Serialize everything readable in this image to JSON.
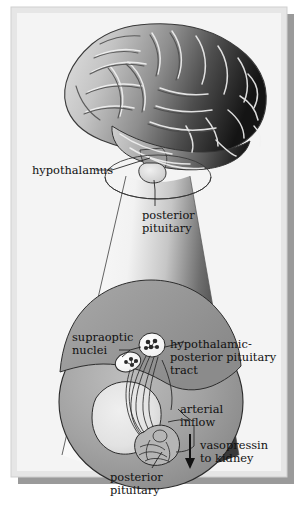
{
  "figure": {
    "type": "anatomical-illustration",
    "dimensions": {
      "width": 302,
      "height": 507
    }
  },
  "frame": {
    "border_color": "#d9d9d9",
    "shadow_color": "#9a9a9a",
    "background_color": "#f3f3f3",
    "page_color": "#ffffff"
  },
  "palette": {
    "brain_light": "#d8d8d8",
    "brain_mid": "#9a9a9a",
    "brain_dark": "#1c1c1c",
    "cone_light": "#fbfbfb",
    "cone_dark": "#3d3d3d",
    "ellipse_fill": "#9e9e9e",
    "ellipse_light": "#e4e4e4",
    "outline": "#2a2a2a",
    "text": "#111111"
  },
  "labels": {
    "hypothalamus": "hypothalamus",
    "posterior_pituitary_upper": [
      "posterior",
      "pituitary"
    ],
    "supraoptic_nuclei": [
      "supraoptic",
      "nuclei"
    ],
    "tract": [
      "hypothalamic-",
      "posterior pituitary",
      "tract"
    ],
    "arterial_inflow": [
      "arterial",
      "inflow"
    ],
    "vasopressin": [
      "vasopressin",
      "to kidney"
    ],
    "posterior_pituitary_lower": [
      "posterior",
      "pituitary"
    ]
  },
  "structures": [
    {
      "name": "brain",
      "description": "lateral view of cerebrum with gyri and sulci, gradient shading"
    },
    {
      "name": "pituitary-gland",
      "description": "small light gland at base of brain"
    },
    {
      "name": "magnification-cone",
      "description": "cone linking brain base to enlarged inset"
    },
    {
      "name": "inset-ellipse",
      "description": "enlarged view of hypothalamus and posterior pituitary"
    },
    {
      "name": "supraoptic-nucleus-upper",
      "description": "neuron cell body cluster"
    },
    {
      "name": "supraoptic-nucleus-lower",
      "description": "neuron cell body cluster"
    },
    {
      "name": "nerve-tract-fibers",
      "description": "axon bundle descending to posterior pituitary"
    },
    {
      "name": "posterior-pituitary-body",
      "description": "neurohypophysis with capillary network"
    },
    {
      "name": "arterial-inflow-vessel",
      "description": "artery supplying the posterior pituitary"
    },
    {
      "name": "vasopressin-arrow",
      "description": "downward arrow indicating hormone release to kidney"
    }
  ]
}
